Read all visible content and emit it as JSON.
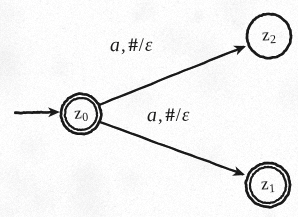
{
  "diagram": {
    "kind": "pushdown-automaton-state-diagram",
    "canvas": {
      "width": 298,
      "height": 217,
      "background": "#fdfdfd",
      "ink": "#1a1a1a"
    },
    "states": [
      {
        "id": "z0",
        "name": "z",
        "subscript": "0",
        "shape": "double-circle",
        "is_start": true,
        "cx": 81,
        "cy": 114,
        "r_outer": 20,
        "r_inner": 16
      },
      {
        "id": "z2",
        "name": "z",
        "subscript": "2",
        "shape": "circle",
        "is_start": false,
        "cx": 269,
        "cy": 36,
        "r_outer": 22,
        "r_inner": 0
      },
      {
        "id": "z1",
        "name": "z",
        "subscript": "1",
        "shape": "double-circle",
        "is_start": false,
        "cx": 268,
        "cy": 185,
        "r_outer": 22,
        "r_inner": 18
      }
    ],
    "start_arrow": {
      "label": "start-transition",
      "x1": 15,
      "y1": 113,
      "x2": 60,
      "y2": 112
    },
    "transitions": [
      {
        "id": "t-z0-z2",
        "from": "z0",
        "to": "z2",
        "input": "a",
        "stack_pop": "#",
        "stack_push": "ε",
        "label": "a, #/ε",
        "x1": 99,
        "y1": 105,
        "x2": 246,
        "y2": 46
      },
      {
        "id": "t-z0-z1",
        "from": "z0",
        "to": "z1",
        "input": "a",
        "stack_pop": "#",
        "stack_push": "ε",
        "label": "a, #/ε",
        "x1": 100,
        "y1": 122,
        "x2": 245,
        "y2": 175
      }
    ],
    "labels": {
      "transition_top": {
        "symbol": "a",
        "comma": ",",
        "pop": "#",
        "slash": "/",
        "push": "ε"
      },
      "transition_bottom": {
        "symbol": "a",
        "comma": ",",
        "pop": "#",
        "slash": "/",
        "push": "ε"
      }
    }
  }
}
